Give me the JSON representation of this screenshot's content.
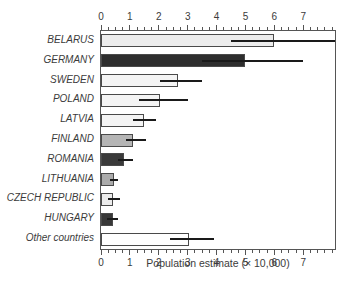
{
  "chart_data": {
    "type": "bar",
    "orientation": "horizontal",
    "title": "",
    "xlabel": "Population estimate (× 10,000)",
    "ylabel": "",
    "categories": [
      "BELARUS",
      "GERMANY",
      "SWEDEN",
      "POLAND",
      "LATVIA",
      "FINLAND",
      "ROMANIA",
      "LITHUANIA",
      "CZECH REPUBLIC",
      "HUNGARY",
      "Other countries"
    ],
    "values": [
      6.0,
      5.0,
      2.65,
      2.05,
      1.5,
      1.1,
      0.8,
      0.45,
      0.4,
      0.4,
      3.05
    ],
    "error_low": [
      4.5,
      3.5,
      2.05,
      1.3,
      1.1,
      0.85,
      0.6,
      0.3,
      0.25,
      0.22,
      2.4
    ],
    "error_high": [
      8.1,
      7.0,
      3.5,
      3.0,
      1.9,
      1.55,
      1.1,
      0.6,
      0.65,
      0.58,
      3.9
    ],
    "bar_colors": [
      "#ececec",
      "#2e2e2e",
      "#f4f4f4",
      "#f4f4f4",
      "#f4f4f4",
      "#b5b5b5",
      "#3a3a3a",
      "#ababab",
      "#ececec",
      "#383838",
      "#ffffff"
    ],
    "xlim": [
      0,
      8.1
    ],
    "x_major_ticks": [
      0,
      1,
      2,
      3,
      4,
      5,
      6,
      7
    ],
    "x_tick_labels": [
      "0",
      "1",
      "2",
      "3",
      "4",
      "5",
      "6",
      "7"
    ],
    "x_minor_tick_step": 0.25,
    "grid": false,
    "axes_style": "full-box, ticks outside on top and bottom, error bars without caps"
  },
  "colors": {
    "background": "#ffffff",
    "bar_border": "#4a4a4a",
    "error_bar": "#1a1a1a",
    "axis": "#555555",
    "text": "#3b3b3b"
  }
}
